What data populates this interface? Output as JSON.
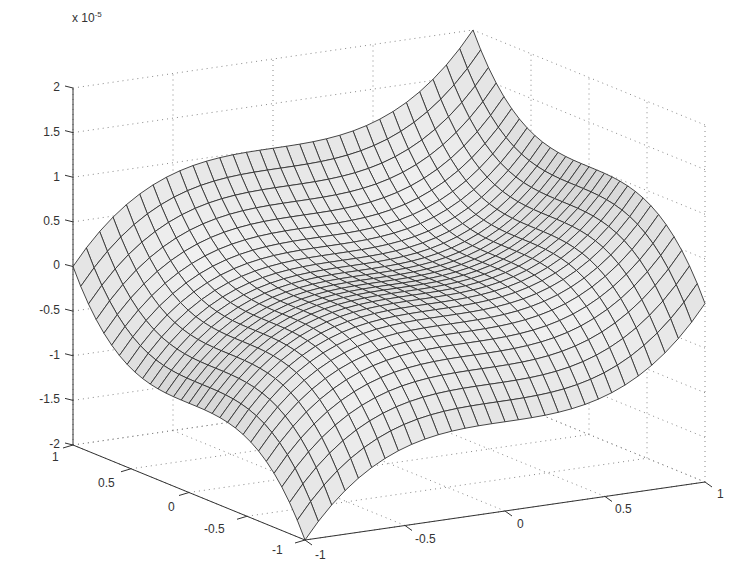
{
  "chart_data": {
    "type": "surface3d",
    "title": "",
    "z_multiplier": "x 10",
    "z_exponent": "-5",
    "xlabel": "",
    "ylabel": "",
    "zlabel": "",
    "x_ticks": [
      "-1",
      "-0.5",
      "0",
      "0.5",
      "1"
    ],
    "y_ticks": [
      "1",
      "0.5",
      "0",
      "-0.5",
      "-1"
    ],
    "z_ticks": [
      "2",
      "1.5",
      "1",
      "0.5",
      "0",
      "-0.5",
      "-1",
      "-1.5",
      "-2"
    ],
    "xlim": [
      -1,
      1
    ],
    "ylim": [
      -1,
      1
    ],
    "zlim": [
      -2e-05,
      2e-05
    ],
    "grid": true,
    "grid_style": "dotted",
    "mesh_resolution": [
      31,
      31
    ],
    "surface_color": "#d8d8d8",
    "edge_color": "#333333",
    "corner_values": {
      "x=-1,y=1": 0,
      "x=1,y=1": 2e-05,
      "x=-1,y=-1": -2e-05,
      "x=1,y=-1": 0
    }
  }
}
